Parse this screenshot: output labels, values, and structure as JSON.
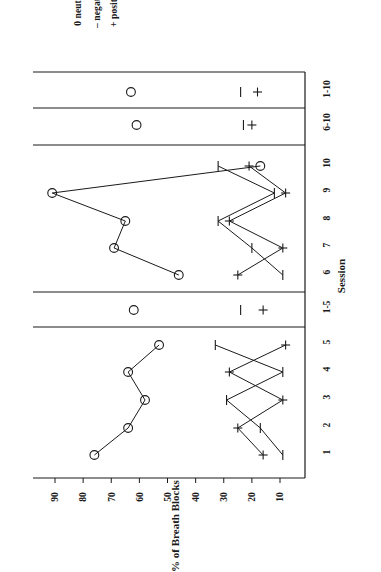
{
  "legend": {
    "items": [
      {
        "symbol": "+",
        "label": "positive",
        "key": "positive"
      },
      {
        "symbol": "–",
        "label": "negative",
        "key": "negative"
      },
      {
        "symbol": "0",
        "label": "neutral",
        "key": "neutral"
      }
    ]
  },
  "chart_data": {
    "type": "line",
    "title": "",
    "subtitle": "",
    "xlabel": "Session",
    "ylabel": "% of Breath Blocks",
    "ylim": [
      0,
      95
    ],
    "yticks": [
      90,
      80,
      70,
      60,
      50,
      40,
      30,
      20,
      10
    ],
    "grid": false,
    "legend_position": "top-left",
    "orientation": "page-rotated-90-ccw",
    "categories": [
      "1",
      "2",
      "3",
      "4",
      "5",
      "1-5",
      "6",
      "7",
      "8",
      "9",
      "10",
      "6-10",
      "1-10"
    ],
    "panel_breaks_after": [
      "5",
      "1-5",
      "10",
      "6-10"
    ],
    "series": [
      {
        "name": "neutral",
        "symbol": "0",
        "marker": "open-circle",
        "connected": true,
        "values": [
          76,
          64,
          58,
          64,
          53,
          62,
          46,
          69,
          65,
          91,
          17,
          61,
          63
        ]
      },
      {
        "name": "positive",
        "symbol": "+",
        "marker": "plus",
        "connected": true,
        "values": [
          16,
          25,
          9,
          28,
          8,
          16,
          25,
          9,
          28,
          8,
          21,
          20,
          18
        ]
      },
      {
        "name": "negative",
        "symbol": "–",
        "marker": "dash",
        "connected": true,
        "values": [
          9,
          17,
          29,
          9,
          33,
          24,
          9,
          20,
          32,
          12,
          32,
          23,
          24
        ]
      }
    ],
    "summary_markers": {
      "1-5": {
        "neutral": 62,
        "negative": 24,
        "positive": 16
      },
      "6-10": {
        "neutral": 61,
        "negative": 23,
        "positive": 20
      },
      "1-10": {
        "neutral": 63,
        "negative": 24,
        "positive": 18
      }
    }
  },
  "axis": {
    "x_tick_labels": [
      "1",
      "2",
      "3",
      "4",
      "5",
      "1-5",
      "6",
      "7",
      "8",
      "9",
      "10",
      "6-10",
      "1-10"
    ],
    "y_tick_labels": [
      "90",
      "80",
      "70",
      "60",
      "50",
      "40",
      "30",
      "20",
      "10"
    ]
  }
}
